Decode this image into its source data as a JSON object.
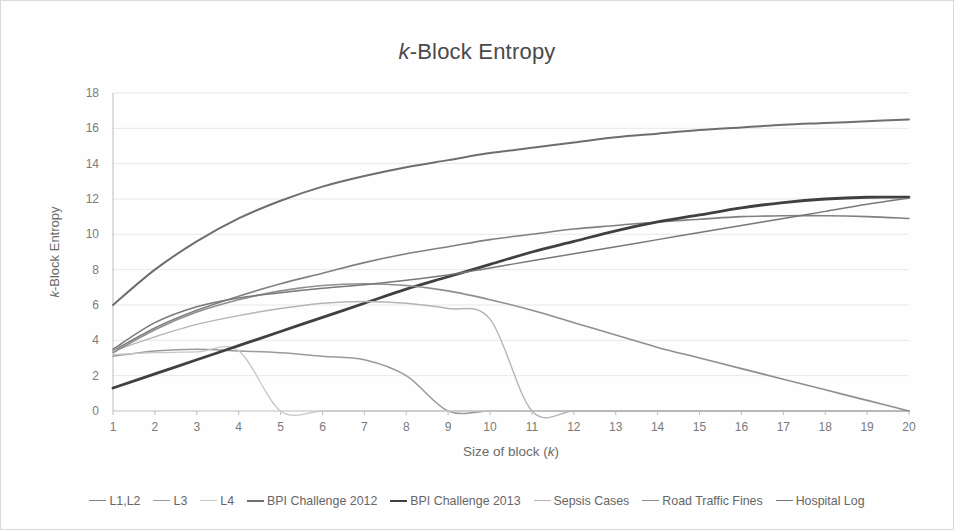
{
  "figure": {
    "title_prefix": "k",
    "title_rest": "-Block Entropy"
  },
  "chart_data": {
    "type": "line",
    "title": "k-Block Entropy",
    "xlabel": "Size of block (k)",
    "ylabel": "k-Block Entropy",
    "xlim": [
      1,
      20
    ],
    "ylim": [
      0,
      18
    ],
    "x": [
      1,
      2,
      3,
      4,
      5,
      6,
      7,
      8,
      9,
      10,
      11,
      12,
      13,
      14,
      15,
      16,
      17,
      18,
      19,
      20
    ],
    "xticks": [
      "1",
      "2",
      "3",
      "4",
      "5",
      "6",
      "7",
      "8",
      "9",
      "10",
      "11",
      "12",
      "13",
      "14",
      "15",
      "16",
      "17",
      "18",
      "19",
      "20"
    ],
    "yticks": [
      "0",
      "2",
      "4",
      "6",
      "8",
      "10",
      "12",
      "14",
      "16",
      "18"
    ],
    "grid": true,
    "legend_position": "bottom",
    "series": [
      {
        "name": "L1,L2",
        "color": "#808080",
        "width": 1.6,
        "values": [
          3.4,
          4.7,
          5.7,
          6.5,
          7.2,
          7.8,
          8.4,
          8.9,
          9.3,
          9.7,
          10.0,
          10.3,
          10.5,
          10.7,
          10.85,
          11.0,
          11.05,
          11.05,
          11.0,
          10.9
        ]
      },
      {
        "name": "L3",
        "color": "#9a9a9a",
        "width": 1.5,
        "values": [
          3.1,
          3.4,
          3.5,
          3.4,
          3.3,
          3.1,
          2.9,
          2.0,
          0.0,
          0.0,
          0.0,
          0.0,
          0.0,
          0.0,
          0.0,
          0.0,
          0.0,
          0.0,
          0.0,
          0.0
        ]
      },
      {
        "name": "L4",
        "color": "#c8c8c8",
        "width": 1.3,
        "values": [
          3.2,
          3.3,
          3.35,
          3.4,
          0.0,
          0.0,
          0.0,
          0.0,
          0.0,
          0.0,
          0.0,
          0.0,
          0.0,
          0.0,
          0.0,
          0.0,
          0.0,
          0.0,
          0.0,
          0.0
        ]
      },
      {
        "name": "BPI Challenge 2012",
        "color": "#6e6e6e",
        "width": 2.0,
        "values": [
          6.0,
          8.0,
          9.6,
          10.9,
          11.9,
          12.7,
          13.3,
          13.8,
          14.2,
          14.6,
          14.9,
          15.2,
          15.5,
          15.7,
          15.9,
          16.05,
          16.2,
          16.3,
          16.4,
          16.5
        ]
      },
      {
        "name": "BPI Challenge 2013",
        "color": "#404040",
        "width": 2.8,
        "values": [
          1.3,
          2.1,
          2.9,
          3.7,
          4.5,
          5.3,
          6.1,
          6.9,
          7.6,
          8.3,
          9.0,
          9.6,
          10.2,
          10.7,
          11.1,
          11.5,
          11.8,
          12.0,
          12.1,
          12.1
        ]
      },
      {
        "name": "Sepsis Cases",
        "color": "#b5b5b5",
        "width": 1.4,
        "values": [
          3.4,
          4.2,
          4.9,
          5.4,
          5.8,
          6.1,
          6.2,
          6.1,
          5.8,
          5.2,
          0.0,
          0.0,
          0.0,
          0.0,
          0.0,
          0.0,
          0.0,
          0.0,
          0.0,
          0.0
        ]
      },
      {
        "name": "Road Traffic Fines",
        "color": "#8f8f8f",
        "width": 1.6,
        "values": [
          3.3,
          4.6,
          5.6,
          6.3,
          6.8,
          7.1,
          7.2,
          7.1,
          6.8,
          6.3,
          5.7,
          5.0,
          4.3,
          3.6,
          3.0,
          2.4,
          1.8,
          1.2,
          0.6,
          0.0
        ]
      },
      {
        "name": "Hospital  Log",
        "color": "#787878",
        "width": 1.5,
        "values": [
          3.5,
          5.0,
          5.9,
          6.4,
          6.7,
          6.95,
          7.15,
          7.4,
          7.7,
          8.1,
          8.5,
          8.9,
          9.3,
          9.7,
          10.1,
          10.5,
          10.9,
          11.3,
          11.7,
          12.05
        ]
      }
    ]
  }
}
